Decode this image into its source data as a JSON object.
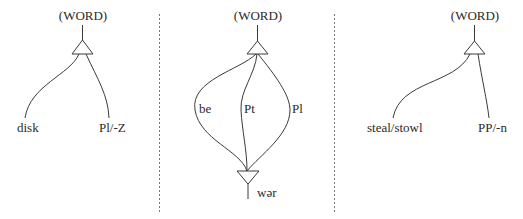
{
  "panels": [
    {
      "root": "(WORD)",
      "left_leaf": "disk",
      "right_leaf": "Pl/-Z"
    },
    {
      "root": "(WORD)",
      "branches": [
        "be",
        "Pt",
        "Pl"
      ],
      "bottom_leaf": "wər"
    },
    {
      "root": "(WORD)",
      "left_leaf": "steal/stowl",
      "right_leaf": "PP/-n"
    }
  ],
  "colors": {
    "line": "#3a3a3a",
    "divider": "#777777",
    "background": "#ffffff"
  }
}
